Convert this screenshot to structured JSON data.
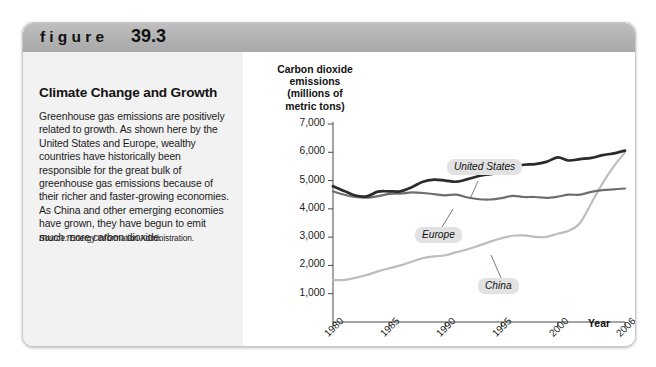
{
  "figure": {
    "label": "figure",
    "number": "39.3"
  },
  "panel": {
    "title": "Climate Change and Growth",
    "body": "Greenhouse gas emissions are positively related to growth. As shown here by the United States and Europe, wealthy countries have historically been responsible for the great bulk of greenhouse gas emissions because of their richer and faster-growing economies. As China and other emerging economies have grown, they have begun to emit much more carbon dioxide.",
    "source_word": "Source:",
    "source_text": " Energy Information Administration."
  },
  "chart_data": {
    "type": "line",
    "title": "",
    "ylabel": "Carbon dioxide emissions (millions of metric tons)",
    "ylabel_lines": [
      "Carbon dioxide",
      "emissions",
      "(millions of",
      "metric tons)"
    ],
    "xlabel": "Year",
    "ylim": [
      0,
      7000
    ],
    "yticks": [
      1000,
      2000,
      3000,
      4000,
      5000,
      6000,
      7000
    ],
    "ytick_labels": [
      "1,000",
      "2,000",
      "3,000",
      "4,000",
      "5,000",
      "6,000",
      "7,000"
    ],
    "xlim": [
      1980,
      2006
    ],
    "xticks": [
      1980,
      1985,
      1990,
      1995,
      2000,
      2006
    ],
    "xtick_labels": [
      "1980",
      "1985",
      "1990",
      "1995",
      "2000",
      "2006"
    ],
    "grid": false,
    "legend_position": "inline-annotations",
    "x": [
      1980,
      1981,
      1982,
      1983,
      1984,
      1985,
      1986,
      1987,
      1988,
      1989,
      1990,
      1991,
      1992,
      1993,
      1994,
      1995,
      1996,
      1997,
      1998,
      1999,
      2000,
      2001,
      2002,
      2003,
      2004,
      2005,
      2006
    ],
    "series": [
      {
        "name": "United States",
        "color": "#2b2b2b",
        "values": [
          4800,
          4630,
          4470,
          4440,
          4610,
          4620,
          4620,
          4760,
          4960,
          5030,
          5000,
          4960,
          5050,
          5160,
          5230,
          5290,
          5480,
          5560,
          5580,
          5660,
          5820,
          5710,
          5760,
          5800,
          5900,
          5960,
          6060
        ]
      },
      {
        "name": "Europe",
        "color": "#6e6e6e",
        "values": [
          4620,
          4500,
          4420,
          4400,
          4450,
          4530,
          4540,
          4580,
          4560,
          4520,
          4480,
          4500,
          4400,
          4340,
          4330,
          4380,
          4460,
          4420,
          4420,
          4390,
          4430,
          4500,
          4500,
          4600,
          4660,
          4690,
          4720
        ]
      },
      {
        "name": "China",
        "color": "#bdbdbd",
        "values": [
          1480,
          1490,
          1560,
          1660,
          1790,
          1900,
          2000,
          2130,
          2260,
          2320,
          2360,
          2470,
          2570,
          2700,
          2840,
          2960,
          3050,
          3060,
          3010,
          3010,
          3120,
          3230,
          3500,
          4200,
          4900,
          5500,
          6000
        ]
      }
    ],
    "annotations": [
      {
        "name": "United States",
        "text": "United States"
      },
      {
        "name": "Europe",
        "text": "Europe"
      },
      {
        "name": "China",
        "text": "China"
      }
    ]
  }
}
